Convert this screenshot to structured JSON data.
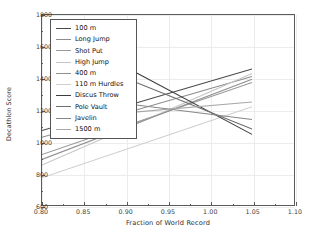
{
  "chart_data": {
    "type": "line",
    "title": "",
    "xlabel": "Fraction of World Record",
    "ylabel": "Decathlon Score",
    "xlim": [
      0.8,
      1.1
    ],
    "ylim": [
      600,
      1800
    ],
    "xticks": [
      "0.80",
      "0.85",
      "0.90",
      "0.95",
      "1.00",
      "1.05",
      "1.10"
    ],
    "xtick_values": [
      0.8,
      0.85,
      0.9,
      0.95,
      1.0,
      1.05,
      1.1
    ],
    "yticks": [
      "600",
      "800",
      "1000",
      "1200",
      "1400",
      "1600",
      "1800"
    ],
    "ytick_values": [
      600,
      800,
      1000,
      1200,
      1400,
      1600,
      1800
    ],
    "grid": true,
    "legend_position": "upper left",
    "series": [
      {
        "name": "100 m",
        "color": "#4a4a4a",
        "x": [
          0.8,
          1.05
        ],
        "values": [
          1072,
          1460
        ]
      },
      {
        "name": "Long Jump",
        "color": "#8d8d8d",
        "x": [
          0.8,
          1.05
        ],
        "values": [
          1030,
          1412
        ]
      },
      {
        "name": "Shot Put",
        "color": "#9a9a9a",
        "x": [
          0.8,
          1.05
        ],
        "values": [
          921,
          1375
        ]
      },
      {
        "name": "High Jump",
        "color": "#c4c4c4",
        "x": [
          0.8,
          1.05
        ],
        "values": [
          855,
          1432
        ]
      },
      {
        "name": "400 m",
        "color": "#909090",
        "x": [
          0.8,
          1.05
        ],
        "values": [
          890,
          1395
        ]
      },
      {
        "name": "110 m Hurdles",
        "color": "#cfcfcf",
        "x": [
          0.8,
          1.05
        ],
        "values": [
          775,
          1222
        ]
      },
      {
        "name": "Discus Throw",
        "color": "#3c3c3c",
        "x": [
          0.91,
          1.05
        ],
        "values": [
          1443,
          1048
        ]
      },
      {
        "name": "Pole Vault",
        "color": "#6f6f6f",
        "x": [
          0.91,
          1.05
        ],
        "values": [
          1380,
          1082
        ]
      },
      {
        "name": "Javelin",
        "color": "#868686",
        "x": [
          0.91,
          1.05
        ],
        "values": [
          1235,
          1142
        ]
      },
      {
        "name": "1500 m",
        "color": "#a8a8a8",
        "x": [
          0.91,
          1.05
        ],
        "values": [
          1188,
          1252
        ]
      }
    ]
  }
}
